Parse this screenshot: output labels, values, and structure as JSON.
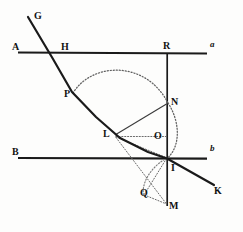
{
  "figure": {
    "canvas": {
      "width": 243,
      "height": 232
    },
    "ink_color": "#1a1a1a",
    "dotted_color": "#6b6b6b"
  },
  "labels": [
    {
      "id": "G",
      "text": "G",
      "x": 34,
      "y": 11,
      "style": "bold"
    },
    {
      "id": "A",
      "text": "A",
      "x": 12,
      "y": 42,
      "style": "bold"
    },
    {
      "id": "H",
      "text": "H",
      "x": 61,
      "y": 42,
      "style": "bold"
    },
    {
      "id": "R",
      "text": "R",
      "x": 164,
      "y": 42,
      "style": "bold"
    },
    {
      "id": "a",
      "text": "a",
      "x": 210,
      "y": 40,
      "style": "italic"
    },
    {
      "id": "P",
      "text": "P",
      "x": 65,
      "y": 89,
      "style": "bold"
    },
    {
      "id": "N",
      "text": "N",
      "x": 171,
      "y": 97,
      "style": "bold"
    },
    {
      "id": "L",
      "text": "L",
      "x": 103,
      "y": 129,
      "style": "bold"
    },
    {
      "id": "O",
      "text": "O",
      "x": 155,
      "y": 132,
      "style": "bold"
    },
    {
      "id": "B",
      "text": "B",
      "x": 12,
      "y": 148,
      "style": "bold"
    },
    {
      "id": "b",
      "text": "b",
      "x": 210,
      "y": 144,
      "style": "italic"
    },
    {
      "id": "I",
      "text": "I",
      "x": 170,
      "y": 163,
      "style": "bold"
    },
    {
      "id": "K",
      "text": "K",
      "x": 214,
      "y": 186,
      "style": "bold"
    },
    {
      "id": "Q",
      "text": "Q",
      "x": 140,
      "y": 188,
      "style": "bold"
    },
    {
      "id": "M",
      "text": "M",
      "x": 170,
      "y": 201,
      "style": "bold"
    }
  ],
  "geometry": {
    "line_a": {
      "name": "horizontal-line-a",
      "x1": 18,
      "y1": 52,
      "x2": 207,
      "y2": 53
    },
    "line_b": {
      "name": "horizontal-line-b",
      "x1": 18,
      "y1": 158,
      "x2": 207,
      "y2": 158
    },
    "ray_GK": {
      "name": "incident-refracted-ray-G-K",
      "points": "28,17 72,92 118,137 167,158 214,185"
    },
    "vertical_RM": {
      "name": "vertical-normal-R-M",
      "x1": 167,
      "y1": 53,
      "x2": 167,
      "y2": 206
    },
    "arc_upper": {
      "name": "upper-dotted-arc-P-N",
      "path": "M 73,93 C 95,62 148,62 168,103"
    },
    "arc_right": {
      "name": "right-dotted-arc-N-I",
      "path": "M 168,103 C 180,122 180,146 167,158"
    },
    "arc_lower": {
      "name": "lower-dotted-arc-I-M",
      "path": "M 167,158 C 150,168 140,184 143,196"
    },
    "seg_LN": {
      "name": "segment-L-to-N",
      "x1": 114,
      "y1": 134,
      "x2": 167,
      "y2": 103
    },
    "seg_LO": {
      "name": "dotted-segment-L-to-O",
      "x1": 114,
      "y1": 136,
      "x2": 167,
      "y2": 136
    },
    "seg_LM": {
      "name": "dotted-segment-L-to-M",
      "x1": 114,
      "y1": 136,
      "x2": 167,
      "y2": 204
    },
    "seg_LI": {
      "name": "dotted-segment-L-to-I",
      "x1": 114,
      "y1": 136,
      "x2": 167,
      "y2": 158
    },
    "seg_IQ": {
      "name": "dotted-segment-I-to-Q",
      "x1": 167,
      "y1": 158,
      "x2": 145,
      "y2": 195
    },
    "seg_QM": {
      "name": "dotted-segment-Q-to-M",
      "x1": 145,
      "y1": 195,
      "x2": 167,
      "y2": 204
    }
  }
}
